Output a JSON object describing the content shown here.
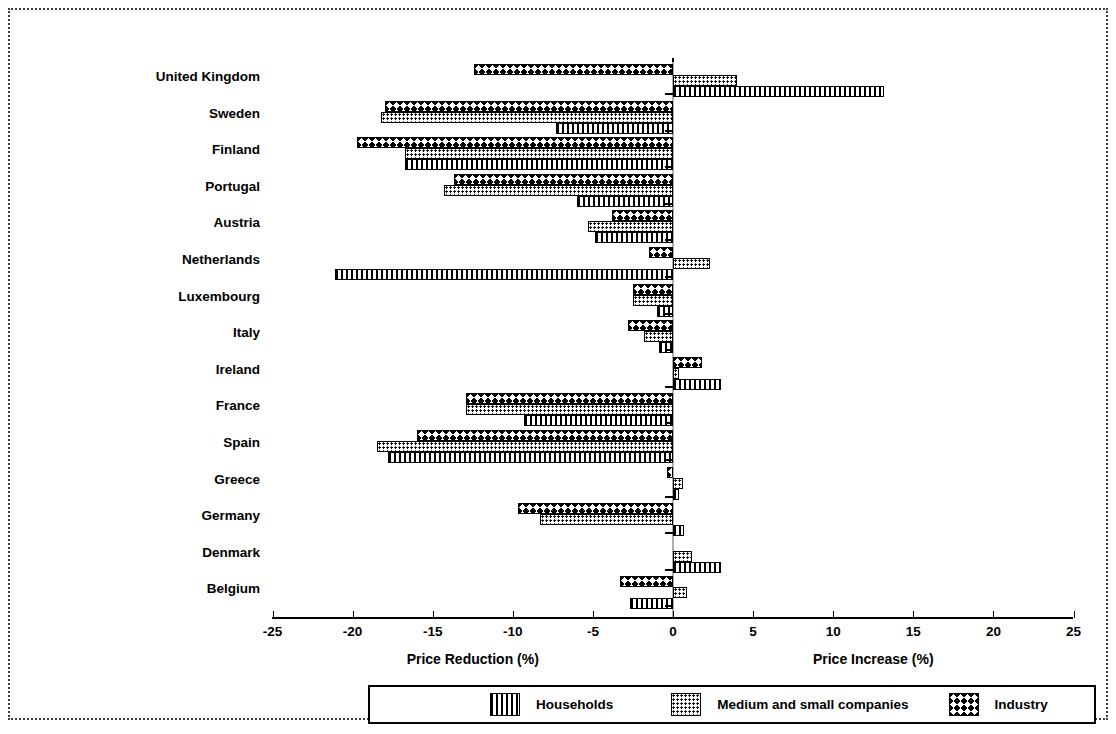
{
  "chart_data": {
    "type": "bar",
    "orientation": "horizontal",
    "title": "",
    "xlabel_left": "Price Reduction (%)",
    "xlabel_right": "Price Increase (%)",
    "ylabel": "",
    "xlim": [
      -25,
      25
    ],
    "xticks": [
      -25,
      -20,
      -15,
      -10,
      -5,
      0,
      5,
      10,
      15,
      20,
      25
    ],
    "xtick_labels": [
      "-25",
      "-20",
      "-15",
      "-10",
      "-5",
      "0",
      "5",
      "10",
      "15",
      "20",
      "25"
    ],
    "grid": false,
    "legend_position": "bottom",
    "categories": [
      "United Kingdom",
      "Sweden",
      "Finland",
      "Portugal",
      "Austria",
      "Netherlands",
      "Luxembourg",
      "Italy",
      "Ireland",
      "France",
      "Spain",
      "Greece",
      "Germany",
      "Denmark",
      "Belgium"
    ],
    "series": [
      {
        "name": "Industry",
        "pattern": "zigzag",
        "values": [
          -12.4,
          -18.0,
          -19.7,
          -13.7,
          -3.8,
          -1.5,
          -2.5,
          -2.8,
          1.8,
          -12.9,
          -16.0,
          -0.4,
          -9.7,
          0.0,
          -3.3
        ]
      },
      {
        "name": "Medium and small companies",
        "pattern": "dots",
        "values": [
          4.0,
          -18.2,
          -16.7,
          -14.3,
          -5.3,
          2.3,
          -2.5,
          -1.8,
          0.4,
          -12.9,
          -18.5,
          0.6,
          -8.3,
          1.2,
          0.9
        ]
      },
      {
        "name": "Households",
        "pattern": "vertical-lines",
        "values": [
          13.2,
          -7.3,
          -16.7,
          -6.0,
          -4.9,
          -21.1,
          -1.0,
          -0.9,
          3.0,
          -9.3,
          -17.8,
          0.4,
          0.7,
          3.0,
          -2.7
        ]
      }
    ]
  },
  "legend": {
    "households_label": "Households",
    "medium_label": "Medium and small companies",
    "industry_label": "Industry"
  }
}
